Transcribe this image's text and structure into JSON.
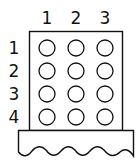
{
  "diagram": {
    "type": "peg-board-grid",
    "columns": [
      "1",
      "2",
      "3"
    ],
    "rows": [
      "1",
      "2",
      "3",
      "4"
    ],
    "cells": [
      [
        "empty",
        "empty",
        "empty"
      ],
      [
        "empty",
        "empty",
        "empty"
      ],
      [
        "empty",
        "empty",
        "empty"
      ],
      [
        "empty",
        "empty",
        "empty"
      ]
    ],
    "colors": {
      "stroke": "#111111",
      "background": "#ffffff"
    }
  }
}
